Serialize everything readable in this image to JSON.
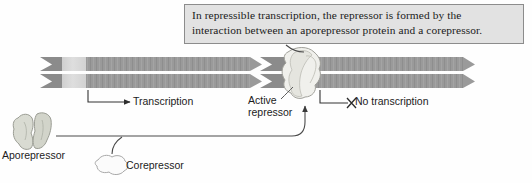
{
  "figure": {
    "background_color": "#fefefe"
  },
  "caption": {
    "line1": "In repressible transcription, the repressor is formed by the",
    "line2": "interaction between an aporepressor protein and a corepressor.",
    "fill_color": "#e2e2e2",
    "border_color": "#8c8c8c"
  },
  "labels": {
    "transcription": "Transcription",
    "active_repressor_line1": "Active",
    "active_repressor_line2": "repressor",
    "no_transcription": "No transcription",
    "aporepressor": "Aporepressor",
    "corepressor": "Corepressor"
  },
  "dna": {
    "strand_color": "#8b8b8b",
    "gene_color": "#9a9a9a",
    "operator_color": "#d6d6d6",
    "left_segment_label": "",
    "right_segment_label": ""
  },
  "molecules": {
    "aporepressor_fill": "#d9dbd2",
    "aporepressor_stroke": "#9a9c93",
    "corepressor_fill": "#fbfbfb",
    "corepressor_stroke": "#a8a8a8",
    "active_repressor_fill": "#f0f0ec",
    "active_repressor_stroke": "#a0a09a"
  },
  "markers": {
    "no_transcription_mark": "✕",
    "transcription_arrow": "→"
  }
}
